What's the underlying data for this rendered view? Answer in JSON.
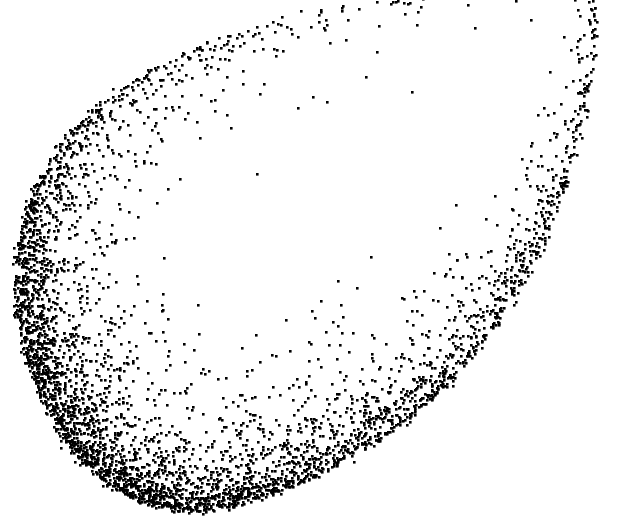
{
  "figure": {
    "width": 627,
    "height": 528,
    "background_color": "#ffffff",
    "title": "",
    "caption": ""
  },
  "chart_data": {
    "type": "scatter",
    "title": "",
    "subtitle": "",
    "xlabel": "",
    "ylabel": "",
    "xlim": [
      0,
      627
    ],
    "ylim": [
      0,
      528
    ],
    "grid": false,
    "axes_visible": false,
    "tick_labels_x": [],
    "tick_labels_y": [],
    "legend": [],
    "legend_position": "none",
    "annotations": [],
    "marker": {
      "shape": "square",
      "size_px": 2.6,
      "color": "#000000",
      "edge_color": "#000000",
      "opacity": 1
    },
    "point_count_approx": 4200,
    "shape_model": {
      "kind": "closed-parametric-band",
      "center": [
        310,
        250
      ],
      "outline_points": [
        [
          588,
          -40
        ],
        [
          597,
          10
        ],
        [
          596,
          48
        ],
        [
          590,
          86
        ],
        [
          582,
          124
        ],
        [
          572,
          162
        ],
        [
          560,
          198
        ],
        [
          546,
          234
        ],
        [
          530,
          268
        ],
        [
          512,
          300
        ],
        [
          492,
          330
        ],
        [
          470,
          358
        ],
        [
          446,
          384
        ],
        [
          420,
          408
        ],
        [
          392,
          430
        ],
        [
          362,
          450
        ],
        [
          330,
          468
        ],
        [
          296,
          483
        ],
        [
          262,
          496
        ],
        [
          230,
          505
        ],
        [
          198,
          510
        ],
        [
          168,
          508
        ],
        [
          140,
          500
        ],
        [
          114,
          486
        ],
        [
          90,
          468
        ],
        [
          70,
          446
        ],
        [
          54,
          420
        ],
        [
          40,
          392
        ],
        [
          30,
          362
        ],
        [
          22,
          330
        ],
        [
          18,
          298
        ],
        [
          18,
          266
        ],
        [
          22,
          234
        ],
        [
          30,
          204
        ],
        [
          42,
          176
        ],
        [
          58,
          150
        ],
        [
          78,
          126
        ],
        [
          102,
          104
        ],
        [
          130,
          84
        ],
        [
          160,
          66
        ],
        [
          194,
          50
        ],
        [
          230,
          36
        ],
        [
          268,
          24
        ],
        [
          308,
          14
        ],
        [
          350,
          6
        ],
        [
          394,
          0
        ],
        [
          440,
          -8
        ],
        [
          486,
          -18
        ],
        [
          532,
          -28
        ],
        [
          570,
          -36
        ]
      ],
      "density_profile": {
        "description": "Density weight around the outline, parameterized by index into outline_points. Peak near the lower-left cusp region.",
        "peak_index_range": [
          24,
          33
        ],
        "peak_weight": 1.0,
        "min_weight": 0.025,
        "bottom_edge_weight": 0.75,
        "right_edge_weight": 0.32,
        "upper_left_weight": 0.06,
        "top_weight": 0.02
      },
      "inward_scatter": {
        "description": "Points spread inward from the crisp outer boundary with an exponential falloff; outward spill is minimal.",
        "outward_sigma_px": 2.5,
        "inward_scale_px": 26,
        "inward_scale_px_dense": 46,
        "tangential_jitter_px": 3
      }
    },
    "bounds_observed": {
      "leftmost_x": 15,
      "rightmost_x": 600,
      "topmost_y": 0,
      "bottommost_y": 513,
      "densest_region": [
        30,
        400,
        130,
        500
      ]
    },
    "stray_interior_points": [
      [
        198,
        305
      ],
      [
        325,
        30
      ],
      [
        366,
        406
      ],
      [
        263,
        429
      ],
      [
        412,
        92
      ],
      [
        211,
        101
      ],
      [
        168,
        189
      ],
      [
        89,
        196
      ],
      [
        151,
        420
      ],
      [
        313,
        97
      ],
      [
        236,
        430
      ],
      [
        287,
        440
      ],
      [
        452,
        295
      ],
      [
        120,
        368
      ],
      [
        185,
        440
      ]
    ]
  }
}
